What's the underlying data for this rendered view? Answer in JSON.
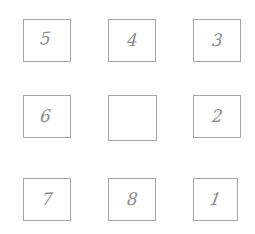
{
  "puzzle": {
    "name": "eight-puzzle-board",
    "rows": 3,
    "cols": 3,
    "tiles": [
      {
        "label": "5"
      },
      {
        "label": "4"
      },
      {
        "label": "3"
      },
      {
        "label": "6"
      },
      {
        "label": ""
      },
      {
        "label": "2"
      },
      {
        "label": "7"
      },
      {
        "label": "8"
      },
      {
        "label": "1"
      }
    ],
    "colors": {
      "background": "#ffffff",
      "tile_border": "#a5a5a5",
      "digit": "#8a8a8a"
    }
  }
}
